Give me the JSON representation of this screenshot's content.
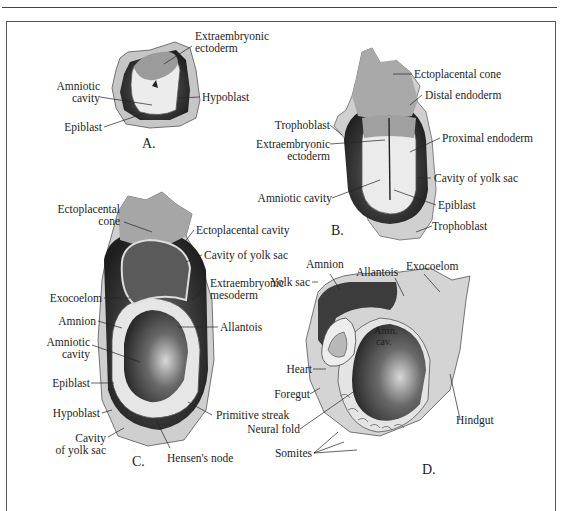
{
  "figure": {
    "panels": {
      "A": {
        "letter": "A.",
        "labels": {
          "extraembryonic_ectoderm_1": "Extraembryonic",
          "extraembryonic_ectoderm_2": "ectoderm",
          "amniotic_cavity_1": "Amniotic",
          "amniotic_cavity_2": "cavity",
          "hypoblast": "Hypoblast",
          "epiblast": "Epiblast"
        }
      },
      "B": {
        "letter": "B.",
        "labels": {
          "ectoplacental_cone": "Ectoplacental cone",
          "distal_endoderm": "Distal endoderm",
          "trophoblast_top": "Trophoblast",
          "proximal_endoderm": "Proximal endoderm",
          "extraembryonic_ectoderm_1": "Extraembryonic",
          "extraembryonic_ectoderm_2": "ectoderm",
          "cavity_of_yolk_sac": "Cavity of yolk sac",
          "amniotic_cavity": "Amniotic cavity",
          "epiblast": "Epiblast",
          "trophoblast_bottom": "Trophoblast"
        }
      },
      "C": {
        "letter": "C.",
        "labels": {
          "ectoplacental_cone_1": "Ectoplacental",
          "ectoplacental_cone_2": "cone",
          "ectoplacental_cavity": "Ectoplacental cavity",
          "cavity_of_yolk_sac_top": "Cavity of yolk sac",
          "extraembryonic_mesoderm_1": "Extraembryonic",
          "extraembryonic_mesoderm_2": "mesoderm",
          "exocoelom": "Exocoelom",
          "amnion": "Amnion",
          "allantois": "Allantois",
          "amniotic_cavity_1": "Amniotic",
          "amniotic_cavity_2": "cavity",
          "epiblast": "Epiblast",
          "primitive_streak": "Primitive streak",
          "hypoblast": "Hypoblast",
          "cavity_of_yolk_sac_1": "Cavity",
          "cavity_of_yolk_sac_2": "of yolk sac",
          "hensens_node": "Hensen's node"
        }
      },
      "D": {
        "letter": "D.",
        "labels": {
          "amnion": "Amnion",
          "allantois": "Allantois",
          "exocoelom": "Exocoelom",
          "yolk_sac": "Yolk sac",
          "amn_cav_1": "Amn.",
          "amn_cav_2": "cav.",
          "heart": "Heart",
          "foregut": "Foregut",
          "neural_fold": "Neural fold",
          "hindgut": "Hindgut",
          "somites": "Somites"
        }
      }
    },
    "colors": {
      "outer_tissue": "#c9c9c9",
      "cone_gray": "#a8a8a8",
      "dark_layer": "#3a3a3a",
      "light_fill": "#ececec",
      "line": "#222222"
    }
  }
}
